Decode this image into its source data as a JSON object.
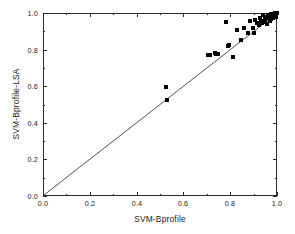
{
  "chart_data": {
    "type": "scatter",
    "title": "",
    "xlabel": "SVM-Bprofile",
    "ylabel": "SVM-Bprofile-LSA",
    "xlim": [
      0.0,
      1.0
    ],
    "ylim": [
      0.0,
      1.0
    ],
    "grid": false,
    "legend": null,
    "x_ticks": [
      "0.0",
      "0.2",
      "0.4",
      "0.6",
      "0.8",
      "1.0"
    ],
    "x_tick_values": [
      0.0,
      0.2,
      0.4,
      0.6,
      0.8,
      1.0
    ],
    "y_ticks": [
      "0.0",
      "0.2",
      "0.4",
      "0.6",
      "0.8",
      "1.0"
    ],
    "y_tick_values": [
      0.0,
      0.2,
      0.4,
      0.6,
      0.8,
      1.0
    ],
    "minor_ticks": true,
    "marker_style": "filled-square",
    "marker_color": "#000000",
    "reference_line": {
      "label": "y = x diagonal",
      "from": [
        0.0,
        0.0
      ],
      "to": [
        1.0,
        1.0
      ],
      "color": "#3a3a3a"
    },
    "series": [
      {
        "name": "models",
        "points": [
          [
            0.525,
            0.598
          ],
          [
            0.528,
            0.522
          ],
          [
            0.706,
            0.772
          ],
          [
            0.712,
            0.77
          ],
          [
            0.733,
            0.784
          ],
          [
            0.741,
            0.776
          ],
          [
            0.748,
            0.778
          ],
          [
            0.781,
            0.95
          ],
          [
            0.79,
            0.82
          ],
          [
            0.795,
            0.824
          ],
          [
            0.812,
            0.758
          ],
          [
            0.828,
            0.905
          ],
          [
            0.845,
            0.855
          ],
          [
            0.858,
            0.92
          ],
          [
            0.878,
            0.893
          ],
          [
            0.885,
            0.958
          ],
          [
            0.898,
            0.918
          ],
          [
            0.902,
            0.892
          ],
          [
            0.908,
            0.963
          ],
          [
            0.915,
            0.948
          ],
          [
            0.922,
            0.935
          ],
          [
            0.928,
            0.972
          ],
          [
            0.933,
            0.958
          ],
          [
            0.938,
            0.944
          ],
          [
            0.941,
            0.988
          ],
          [
            0.947,
            0.966
          ],
          [
            0.95,
            0.952
          ],
          [
            0.955,
            0.98
          ],
          [
            0.958,
            0.94
          ],
          [
            0.962,
            0.99
          ],
          [
            0.964,
            0.972
          ],
          [
            0.968,
            0.958
          ],
          [
            0.97,
            0.986
          ],
          [
            0.973,
            0.994
          ],
          [
            0.976,
            0.966
          ],
          [
            0.978,
            0.982
          ],
          [
            0.981,
            0.992
          ],
          [
            0.983,
            0.974
          ],
          [
            0.985,
            0.988
          ],
          [
            0.987,
            0.996
          ],
          [
            0.989,
            0.98
          ],
          [
            0.99,
            0.99
          ],
          [
            0.992,
            0.998
          ],
          [
            0.993,
            0.986
          ],
          [
            0.995,
            0.994
          ],
          [
            0.996,
            0.978
          ],
          [
            0.997,
            0.99
          ],
          [
            0.998,
            0.998
          ]
        ]
      }
    ]
  }
}
